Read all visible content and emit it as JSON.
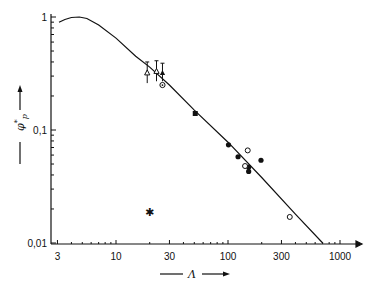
{
  "chart_data": {
    "type": "scatter",
    "title": "",
    "xlabel": "Λ",
    "ylabel": "φ*p",
    "xscale": "log",
    "yscale": "log",
    "xlim": [
      2.7,
      1400
    ],
    "ylim": [
      0.01,
      1
    ],
    "grid": false,
    "legend": "none",
    "x_ticks": [
      3,
      10,
      30,
      100,
      300,
      1000
    ],
    "x_tick_labels": [
      "3",
      "10",
      "30",
      "100",
      "300",
      "1000"
    ],
    "y_ticks": [
      0.01,
      0.1,
      1
    ],
    "y_tick_labels": [
      "0,01",
      "0,1",
      "1"
    ],
    "series": [
      {
        "name": "theory-curve",
        "kind": "line",
        "x": [
          3.1,
          3.5,
          4.0,
          4.7,
          5.5,
          7.0,
          10,
          15,
          20,
          30,
          50,
          100,
          200,
          400,
          700
        ],
        "y": [
          0.9,
          0.95,
          0.99,
          1.0,
          0.97,
          0.85,
          0.65,
          0.45,
          0.36,
          0.25,
          0.15,
          0.078,
          0.038,
          0.018,
          0.01
        ]
      },
      {
        "name": "open-triangle-errorbar",
        "kind": "points",
        "marker": "open-triangle",
        "x": [
          19
        ],
        "y": [
          0.32
        ],
        "y_err_up": [
          0.08
        ],
        "y_err_down": [
          0.06
        ]
      },
      {
        "name": "triangle-errorbar",
        "kind": "points",
        "marker": "open-triangle",
        "x": [
          23
        ],
        "y": [
          0.33
        ],
        "y_err_up": [
          0.08
        ],
        "y_err_down": [
          0.06
        ]
      },
      {
        "name": "filled-triangle-errorbar",
        "kind": "points",
        "marker": "filled-triangle",
        "x": [
          26
        ],
        "y": [
          0.32
        ],
        "y_err_up": [
          0.07
        ],
        "y_err_down": [
          0.05
        ]
      },
      {
        "name": "circle-dot",
        "kind": "points",
        "marker": "circle-dot",
        "x": [
          26
        ],
        "y": [
          0.25
        ]
      },
      {
        "name": "filled-square",
        "kind": "points",
        "marker": "filled-square",
        "x": [
          51
        ],
        "y": [
          0.14
        ]
      },
      {
        "name": "filled-circles",
        "kind": "points",
        "marker": "filled-circle",
        "x": [
          101,
          123,
          153,
          153,
          197
        ],
        "y": [
          0.074,
          0.058,
          0.047,
          0.043,
          0.054
        ]
      },
      {
        "name": "open-circles",
        "kind": "points",
        "marker": "open-circle",
        "x": [
          150,
          142,
          356
        ],
        "y": [
          0.066,
          0.048,
          0.017
        ]
      },
      {
        "name": "star",
        "kind": "points",
        "marker": "star",
        "x": [
          20
        ],
        "y": [
          0.019
        ]
      }
    ]
  },
  "axes": {
    "x_title": "Λ",
    "y_title_main": "φ",
    "y_title_sub": "p",
    "y_title_sup": "*"
  }
}
